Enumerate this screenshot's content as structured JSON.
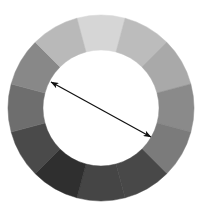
{
  "diagram": {
    "type": "color-wheel",
    "geometry": {
      "center_x": 101,
      "center_y": 108,
      "outer_radius": 93,
      "inner_radius": 58,
      "segment_count": 12,
      "start_angle_deg": -15
    },
    "segments": [
      {
        "position": "0deg-top",
        "color": "#d6d6d6"
      },
      {
        "position": "30deg",
        "color": "#bcbcbc"
      },
      {
        "position": "60deg",
        "color": "#a9a9a9"
      },
      {
        "position": "90deg-right",
        "color": "#8a8a8a"
      },
      {
        "position": "120deg",
        "color": "#7b7b7b"
      },
      {
        "position": "150deg",
        "color": "#484848"
      },
      {
        "position": "180deg-bottom",
        "color": "#454545"
      },
      {
        "position": "210deg",
        "color": "#2f2f2f"
      },
      {
        "position": "240deg",
        "color": "#4a4a4a"
      },
      {
        "position": "270deg-left",
        "color": "#6e6e6e"
      },
      {
        "position": "300deg",
        "color": "#888888"
      },
      {
        "position": "330deg",
        "color": "#b9b9b9"
      }
    ],
    "arrow": {
      "type": "double-headed",
      "x1": 51,
      "y1": 82,
      "x2": 151,
      "y2": 137,
      "color": "#111111",
      "stroke_width": 1.2
    },
    "background_color": "#ffffff"
  }
}
